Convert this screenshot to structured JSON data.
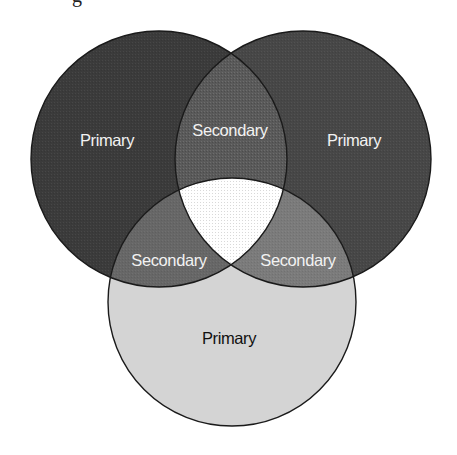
{
  "diagram": {
    "type": "venn-3",
    "title_fragment": "g",
    "colors": {
      "background": "#ffffff",
      "outline": "#1a1a1a",
      "primary_top_left": "#3b3b3b",
      "primary_top_right": "#474747",
      "primary_bottom": "#d4d4d4",
      "secondary_top": "#5a5a5a",
      "secondary_left": "#676767",
      "secondary_right": "#7b7b7b",
      "center": "#ffffff",
      "light_text": "#f2f2f2",
      "dark_text": "#111111"
    },
    "circles": [
      {
        "id": "top-left",
        "cx": 159,
        "cy": 159,
        "r": 128
      },
      {
        "id": "top-right",
        "cx": 303,
        "cy": 159,
        "r": 128
      },
      {
        "id": "bottom",
        "cx": 232,
        "cy": 302,
        "r": 124
      }
    ],
    "regions": {
      "primary_top_left": {
        "label": "Primary"
      },
      "primary_top_right": {
        "label": "Primary"
      },
      "primary_bottom": {
        "label": "Primary"
      },
      "secondary_top": {
        "label": "Secondary"
      },
      "secondary_left": {
        "label": "Secondary"
      },
      "secondary_right": {
        "label": "Secondary"
      },
      "center": {
        "label": ""
      }
    }
  }
}
